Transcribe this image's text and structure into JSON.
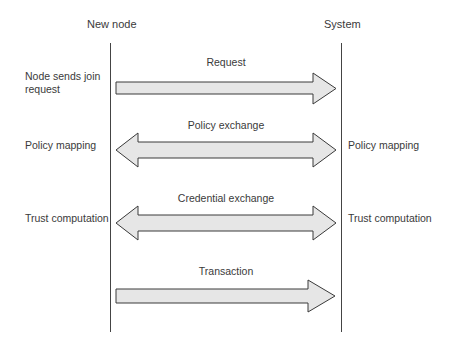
{
  "participants": {
    "left": "New node",
    "right": "System"
  },
  "left_labels": {
    "join": "Node sends join\nrequest",
    "join_line1": "Node sends join",
    "join_line2": "request",
    "policy": "Policy mapping",
    "trust": "Trust computation"
  },
  "right_labels": {
    "policy": "Policy mapping",
    "trust": "Trust computation"
  },
  "messages": [
    {
      "label": "Request",
      "direction": "left-to-right"
    },
    {
      "label": "Policy exchange",
      "direction": "bidirectional"
    },
    {
      "label": "Credential exchange",
      "direction": "bidirectional"
    },
    {
      "label": "Transaction",
      "direction": "left-to-right"
    }
  ],
  "colors": {
    "arrow_fill": "#e6e6e6",
    "arrow_stroke": "#3a3a3a",
    "line": "#444444",
    "text": "#3a3a3a"
  }
}
